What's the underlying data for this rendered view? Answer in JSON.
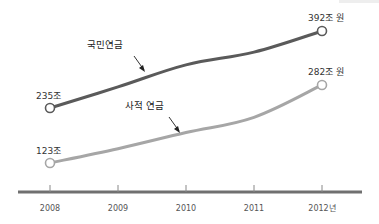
{
  "chart_data": {
    "type": "line",
    "title": "",
    "xlabel": "",
    "ylabel": "",
    "x": [
      "2008",
      "2009",
      "2010",
      "2011",
      "2012"
    ],
    "x_tick_labels": [
      "2008",
      "2009",
      "2010",
      "2011",
      "2012년"
    ],
    "ylim": [
      60,
      400
    ],
    "grid": false,
    "legend": "inline-annotations",
    "series": [
      {
        "name": "국민연금",
        "values": [
          235,
          278,
          323,
          349,
          392
        ],
        "color": "#5a5a5a",
        "start_label": "235조",
        "end_label": "392조 원",
        "annotation_index": 1.5
      },
      {
        "name": "사적 연금",
        "values": [
          123,
          152,
          185,
          216,
          282
        ],
        "color": "#a6a6a6",
        "start_label": "123조",
        "end_label": "282조 원",
        "annotation_index": 2.5
      }
    ],
    "axis_color": "#707070"
  }
}
